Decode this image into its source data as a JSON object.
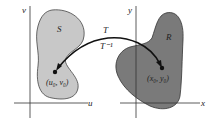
{
  "diagram": {
    "left_plane": {
      "axis_vertical_label": "v",
      "axis_horizontal_label": "u",
      "region_label": "S",
      "point_label": "(u₀, v₀)",
      "region_color": "#c8c8c8"
    },
    "right_plane": {
      "axis_vertical_label": "y",
      "axis_horizontal_label": "x",
      "region_label": "R",
      "point_label": "(x₀, y₀)",
      "region_color": "#7a7a7a"
    },
    "mapping": {
      "forward_label": "T",
      "inverse_label": "T⁻¹"
    }
  }
}
